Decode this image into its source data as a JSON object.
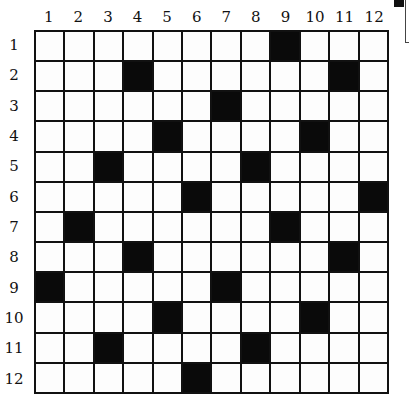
{
  "puzzle": {
    "type": "crossword-grid",
    "rows": 12,
    "cols": 12,
    "column_labels": [
      "1",
      "2",
      "3",
      "4",
      "5",
      "6",
      "7",
      "8",
      "9",
      "10",
      "11",
      "12"
    ],
    "row_labels": [
      "1",
      "2",
      "3",
      "4",
      "5",
      "6",
      "7",
      "8",
      "9",
      "10",
      "11",
      "12"
    ],
    "black_cells": [
      [
        1,
        9
      ],
      [
        2,
        4
      ],
      [
        2,
        11
      ],
      [
        3,
        7
      ],
      [
        4,
        5
      ],
      [
        4,
        10
      ],
      [
        5,
        3
      ],
      [
        5,
        8
      ],
      [
        6,
        6
      ],
      [
        6,
        12
      ],
      [
        7,
        2
      ],
      [
        7,
        9
      ],
      [
        8,
        4
      ],
      [
        8,
        11
      ],
      [
        9,
        1
      ],
      [
        9,
        7
      ],
      [
        10,
        5
      ],
      [
        10,
        10
      ],
      [
        11,
        3
      ],
      [
        11,
        8
      ],
      [
        12,
        6
      ]
    ],
    "colors": {
      "black": "#0a0a0a",
      "white": "#fdfdfd",
      "line": "#111111"
    }
  }
}
